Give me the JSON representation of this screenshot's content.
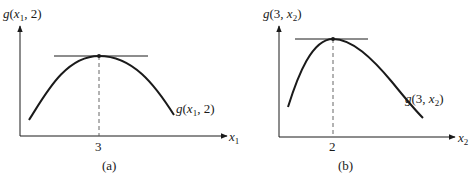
{
  "panels": [
    {
      "id": "a",
      "caption": "(a)",
      "y_axis_label": {
        "fn": "g",
        "args_pre": "(",
        "var": "x",
        "sub": "1",
        "args_post": ", 2)"
      },
      "x_axis_label": {
        "var": "x",
        "sub": "1"
      },
      "curve_label": {
        "fn": "g",
        "args_pre": "(",
        "var": "x",
        "sub": "1",
        "args_post": ", 2)"
      },
      "tick_label": "3",
      "description": "Concave curve g(x1, 2) with maximum at x1 = 3; horizontal tangent at the peak"
    },
    {
      "id": "b",
      "caption": "(b)",
      "y_axis_label": {
        "fn": "g",
        "args_pre": "(3, ",
        "var": "x",
        "sub": "2",
        "args_post": ")"
      },
      "x_axis_label": {
        "var": "x",
        "sub": "2"
      },
      "curve_label": {
        "fn": "g",
        "args_pre": "(3, ",
        "var": "x",
        "sub": "2",
        "args_post": ")"
      },
      "tick_label": "2",
      "description": "Asymmetric concave curve g(3, x2) with maximum at x2 = 2; horizontal tangent at the peak"
    }
  ],
  "colors": {
    "ink": "#1a1a1a",
    "dash": "#555555",
    "background": "#ffffff"
  }
}
